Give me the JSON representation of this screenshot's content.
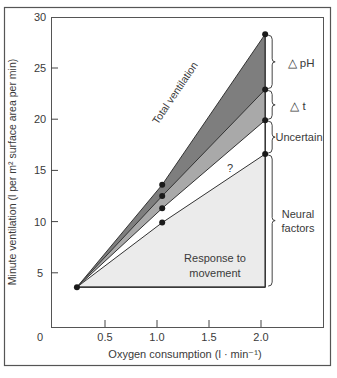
{
  "chart_data": {
    "type": "area",
    "title": "",
    "xlabel": "Oxygen consumption (l · min⁻¹)",
    "ylabel": "Minute ventilation (l per m² surface area per min)",
    "xlim": [
      0,
      2.5
    ],
    "ylim": [
      0,
      30
    ],
    "x_ticks": [
      "0.5",
      "1.0",
      "1.5",
      "2.0"
    ],
    "y_ticks": [
      "5",
      "10",
      "15",
      "20",
      "25",
      "30"
    ],
    "origin_label": "0",
    "grid": false,
    "x": [
      0.23,
      1.05,
      2.04
    ],
    "series": [
      {
        "name": "Response to movement (Neural factors)",
        "values": [
          3.6,
          9.9,
          16.6
        ],
        "color": "#ebebeb"
      },
      {
        "name": "? (Uncertain)",
        "values": [
          3.6,
          11.3,
          19.9
        ],
        "color": "#ffffff"
      },
      {
        "name": "Δt",
        "values": [
          3.6,
          12.5,
          22.9
        ],
        "color": "#a9a9a9"
      },
      {
        "name": "ΔpH / Total ventilation",
        "values": [
          3.6,
          13.6,
          28.3
        ],
        "color": "#7e7e7e"
      }
    ],
    "baseline": 3.6,
    "annotations": {
      "total_ventilation": "Total ventilation",
      "question": "?",
      "response_line1": "Response to",
      "response_line2": "movement",
      "brace_ph": "△ pH",
      "brace_t": "△ t",
      "brace_uncertain": "Uncertain",
      "brace_neural_line1": "Neural",
      "brace_neural_line2": "factors"
    }
  }
}
